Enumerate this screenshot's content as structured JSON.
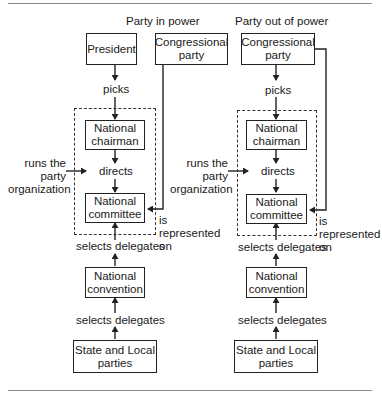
{
  "diagram": {
    "left_panel": {
      "title": "Party in power",
      "boxes": {
        "president": "President",
        "congressional_party": "Congressional\nparty",
        "national_chairman": "National\nchairman",
        "national_committee": "National\ncommittee",
        "national_convention": "National\nconvention",
        "state_local": "State and Local\nparties"
      },
      "labels": {
        "picks": "picks",
        "directs": "directs",
        "selects_delegates_1": "selects delegates",
        "selects_delegates_2": "selects delegates",
        "runs": "runs the\nparty\norganization",
        "represented": "is\nrepresented\non"
      }
    },
    "right_panel": {
      "title": "Party out of power",
      "boxes": {
        "congressional_party": "Congressional\nparty",
        "national_chairman": "National\nchairman",
        "national_committee": "National\ncommittee",
        "national_convention": "National\nconvention",
        "state_local": "State and Local\nparties"
      },
      "labels": {
        "picks": "picks",
        "directs": "directs",
        "selects_delegates_1": "selects delegates",
        "selects_delegates_2": "selects delegates",
        "runs": "runs the\nparty\norganization",
        "represented": "is\nrepresented\non"
      }
    },
    "colors": {
      "line": "#222222",
      "rule": "#8a8a8a",
      "background": "#ffffff"
    }
  }
}
